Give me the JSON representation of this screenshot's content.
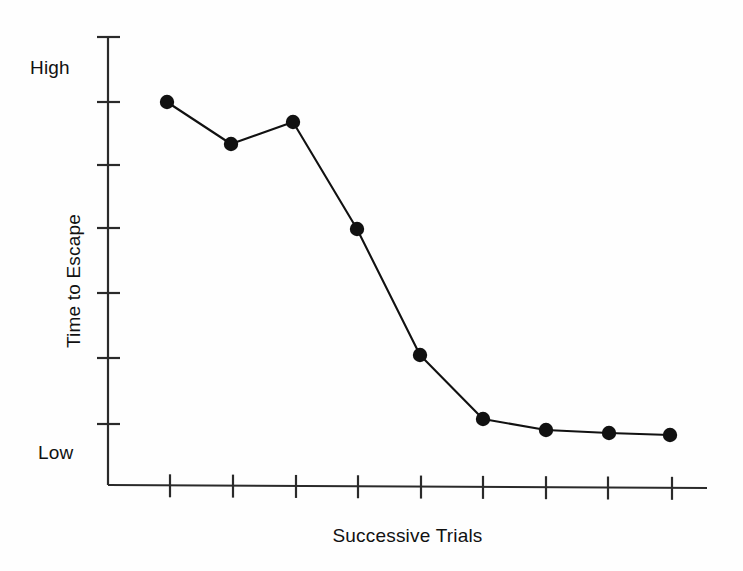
{
  "chart_data": {
    "type": "line",
    "title": "",
    "subtitle": "",
    "xlabel": "Successive Trials",
    "ylabel": "Time to Escape",
    "x": [
      1,
      2,
      3,
      4,
      5,
      6,
      7,
      8,
      9
    ],
    "categories": [
      "1",
      "2",
      "3",
      "4",
      "5",
      "6",
      "7",
      "8",
      "9"
    ],
    "values": [
      8.6,
      7.6,
      8.15,
      5.6,
      2.75,
      1.3,
      1.05,
      0.95,
      0.9
    ],
    "series": [
      {
        "name": "Time to Escape",
        "values": [
          8.6,
          7.6,
          8.15,
          5.6,
          2.75,
          1.3,
          1.05,
          0.95,
          0.9
        ]
      }
    ],
    "ylim": [
      0,
      10
    ],
    "xlim": [
      0.25,
      9.25
    ],
    "grid": false,
    "legend": false,
    "legend_position": "none",
    "ytick_labels": [
      "High",
      "Low"
    ],
    "ytick_label_values": [
      9.3,
      0.45
    ],
    "ytick_count": 7,
    "xtick_count": 9,
    "xtick_labels": [],
    "marker": "filled-circle",
    "line_color": "#111111",
    "marker_color": "#111111",
    "axis_color": "#2a2a2a",
    "background_color": "#fefefe",
    "annotations": []
  },
  "axes": {
    "y_axis": {
      "label_high": "High",
      "label_low": "Low",
      "title": "Time to Escape",
      "tick_positions_px": [
        37,
        102,
        165,
        228,
        293,
        358,
        424
      ],
      "line_x_px": 108,
      "line_top_px": 37,
      "line_bottom_px": 485
    },
    "x_axis": {
      "title": "Successive Trials",
      "tick_positions_px": [
        170,
        233,
        296,
        358,
        421,
        483,
        546,
        608,
        672
      ],
      "line_y_px": 485,
      "line_left_px": 108,
      "line_right_px": 707
    }
  },
  "points_px": [
    {
      "x": 167,
      "y": 102
    },
    {
      "x": 231,
      "y": 144
    },
    {
      "x": 293,
      "y": 122
    },
    {
      "x": 357,
      "y": 229
    },
    {
      "x": 420,
      "y": 355
    },
    {
      "x": 483,
      "y": 419
    },
    {
      "x": 546,
      "y": 430
    },
    {
      "x": 609,
      "y": 433
    },
    {
      "x": 670,
      "y": 435
    }
  ],
  "colors": {
    "ink": "#111111",
    "axis": "#2a2a2a",
    "background": "#fefefe"
  }
}
